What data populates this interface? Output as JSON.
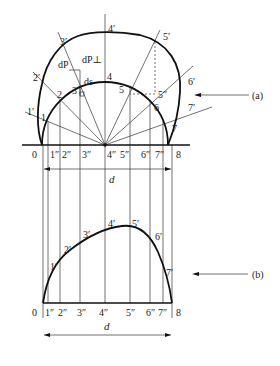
{
  "figure": {
    "part_a": {
      "label": "(a)",
      "inner_points": [
        "1",
        "2",
        "3",
        "4",
        "5",
        "6",
        "7"
      ],
      "outer_points": [
        "1′",
        "2′",
        "3′",
        "4′",
        "5′",
        "6′",
        "7′"
      ],
      "base_ticks": [
        "0",
        "1″",
        "2″",
        "3″",
        "4″",
        "5″",
        "6″",
        "7″",
        "8"
      ],
      "dimension": "d",
      "annotations": {
        "dP": "dP",
        "dP_perp": "dP⊥",
        "ds": "ds",
        "five_dbl": "5″"
      }
    },
    "part_b": {
      "label": "(b)",
      "curve_points": [
        "1′",
        "2′",
        "3′",
        "4′",
        "5′",
        "6′",
        "7′"
      ],
      "base_ticks": [
        "0",
        "1″",
        "2″",
        "3″",
        "4″",
        "5″",
        "6″",
        "7″",
        "8"
      ],
      "dimension": "d"
    }
  }
}
